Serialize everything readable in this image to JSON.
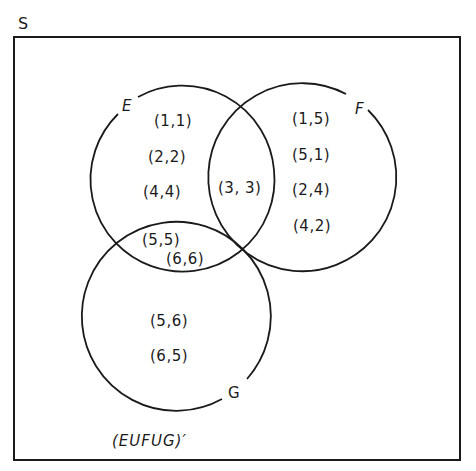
{
  "diagram": {
    "type": "venn",
    "universe": {
      "label": "S"
    },
    "sets": [
      {
        "name": "E",
        "label": "E",
        "only": [
          "(1,1)",
          "(2,2)",
          "(4,4)"
        ]
      },
      {
        "name": "F",
        "label": "F",
        "only": [
          "(1,5)",
          "(5,1)",
          "(2,4)",
          "(4,2)"
        ]
      },
      {
        "name": "G",
        "label": "G",
        "only": [
          "(5,6)",
          "(6,5)"
        ]
      }
    ],
    "intersections": {
      "E_and_F": [
        "(3, 3)"
      ],
      "E_and_G": [
        "(5,5)",
        "(6,6)"
      ]
    },
    "complement": {
      "label": "(EUFUG)′"
    }
  }
}
